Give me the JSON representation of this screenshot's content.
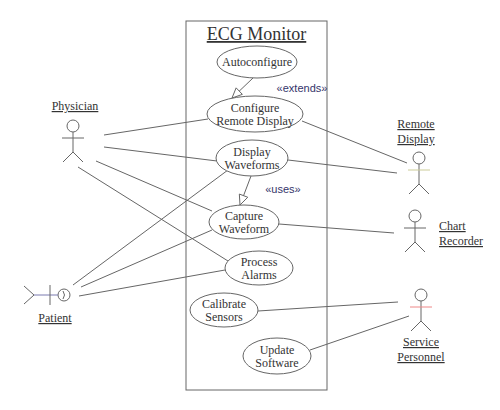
{
  "diagram": {
    "type": "uml-use-case",
    "system": {
      "title": "ECG Monitor",
      "box": {
        "x": 186,
        "y": 21,
        "w": 141,
        "h": 369
      }
    },
    "use_cases": [
      {
        "id": "autoconfigure",
        "lines": [
          "Autoconfigure"
        ],
        "cx": 257,
        "cy": 62,
        "rx": 40,
        "ry": 16
      },
      {
        "id": "configure-remote-display",
        "lines": [
          "Configure",
          "Remote Display"
        ],
        "cx": 255,
        "cy": 114,
        "rx": 48,
        "ry": 18
      },
      {
        "id": "display-waveforms",
        "lines": [
          "Display",
          "Waveforms"
        ],
        "cx": 252,
        "cy": 158,
        "rx": 36,
        "ry": 18
      },
      {
        "id": "capture-waveform",
        "lines": [
          "Capture",
          "Waveform"
        ],
        "cx": 244,
        "cy": 222,
        "rx": 35,
        "ry": 17
      },
      {
        "id": "process-alarms",
        "lines": [
          "Process",
          "Alarms"
        ],
        "cx": 259,
        "cy": 268,
        "rx": 34,
        "ry": 17
      },
      {
        "id": "calibrate-sensors",
        "lines": [
          "Calibrate",
          "Sensors"
        ],
        "cx": 224,
        "cy": 310,
        "rx": 34,
        "ry": 17
      },
      {
        "id": "update-software",
        "lines": [
          "Update",
          "Software"
        ],
        "cx": 277,
        "cy": 356,
        "rx": 34,
        "ry": 18
      }
    ],
    "actors": [
      {
        "id": "physician",
        "label_lines": [
          "Physician"
        ],
        "head": {
          "x": 73,
          "y": 126
        },
        "label_pos": {
          "x": 75,
          "y": 110
        },
        "orientation": "vertical"
      },
      {
        "id": "remote-display",
        "label_lines": [
          "Remote",
          "Display"
        ],
        "head": {
          "x": 419,
          "y": 158
        },
        "label_pos": {
          "x": 416,
          "y": 128
        },
        "orientation": "vertical"
      },
      {
        "id": "chart-recorder",
        "label_lines": [
          "Chart",
          "Recorder"
        ],
        "head": {
          "x": 415,
          "y": 216
        },
        "label_pos": {
          "x": 439,
          "y": 230
        },
        "orientation": "vertical"
      },
      {
        "id": "service-personnel",
        "label_lines": [
          "Service",
          "Personnel"
        ],
        "head": {
          "x": 421,
          "y": 295
        },
        "label_pos": {
          "x": 421,
          "y": 346
        },
        "orientation": "vertical"
      },
      {
        "id": "patient",
        "label_lines": [
          "Patient"
        ],
        "head": {
          "x": 64,
          "y": 295
        },
        "label_pos": {
          "x": 55,
          "y": 322
        },
        "orientation": "horizontal"
      }
    ],
    "associations": [
      {
        "from": "physician",
        "to": "configure-remote-display",
        "x1": 104,
        "y1": 135,
        "x2": 208,
        "y2": 119
      },
      {
        "from": "physician",
        "to": "display-waveforms",
        "x1": 104,
        "y1": 147,
        "x2": 217,
        "y2": 161
      },
      {
        "from": "physician",
        "to": "capture-waveform",
        "x1": 96,
        "y1": 161,
        "x2": 212,
        "y2": 211
      },
      {
        "from": "physician",
        "to": "process-alarms",
        "x1": 78,
        "y1": 167,
        "x2": 228,
        "y2": 261
      },
      {
        "from": "patient",
        "to": "display-waveforms",
        "x1": 73,
        "y1": 285,
        "x2": 228,
        "y2": 170
      },
      {
        "from": "patient",
        "to": "capture-waveform",
        "x1": 81,
        "y1": 287,
        "x2": 212,
        "y2": 230
      },
      {
        "from": "patient",
        "to": "process-alarms",
        "x1": 79,
        "y1": 296,
        "x2": 225,
        "y2": 270
      },
      {
        "from": "configure-remote-display",
        "to": "remote-display",
        "x1": 302,
        "y1": 121,
        "x2": 407,
        "y2": 163
      },
      {
        "from": "display-waveforms",
        "to": "remote-display",
        "x1": 288,
        "y1": 160,
        "x2": 397,
        "y2": 173
      },
      {
        "from": "capture-waveform",
        "to": "chart-recorder",
        "x1": 279,
        "y1": 224,
        "x2": 394,
        "y2": 233
      },
      {
        "from": "calibrate-sensors",
        "to": "service-personnel",
        "x1": 258,
        "y1": 311,
        "x2": 398,
        "y2": 302
      },
      {
        "from": "update-software",
        "to": "service-personnel",
        "x1": 310,
        "y1": 350,
        "x2": 409,
        "y2": 316
      }
    ],
    "relationships": [
      {
        "type": "extends",
        "label": "«extends»",
        "from": "autoconfigure",
        "to": "configure-remote-display",
        "x1": 253,
        "y1": 78,
        "x2": 232,
        "y2": 98,
        "label_pos": {
          "x": 302,
          "y": 92
        }
      },
      {
        "type": "uses",
        "label": "«uses»",
        "from": "display-waveforms",
        "to": "capture-waveform",
        "x1": 251,
        "y1": 176,
        "x2": 240,
        "y2": 205,
        "label_pos": {
          "x": 283,
          "y": 193
        }
      }
    ],
    "colors": {
      "line": "#666666",
      "text": "#333333",
      "stereotype": "#34346a",
      "background": "#ffffff"
    }
  }
}
